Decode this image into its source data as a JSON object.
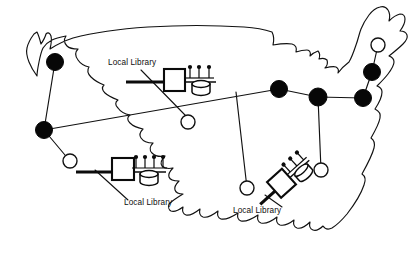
{
  "figure": {
    "name": "us-library-network-map",
    "background_color": "#ffffff",
    "line_color": "#111111",
    "fill_node_color": "#070707",
    "hollow_node_color": "#ffffff",
    "width": 420,
    "height": 278
  },
  "labels": [
    {
      "id": "label-northwest",
      "text": "Local Library",
      "x": 108,
      "y": 65
    },
    {
      "id": "label-southwest",
      "text": "Local Library",
      "x": 124,
      "y": 205
    },
    {
      "id": "label-southeast",
      "text": "Local Library",
      "x": 233,
      "y": 213
    }
  ],
  "nodes": {
    "hubs": [
      {
        "id": "hub-seattle",
        "x": 55,
        "y": 62,
        "r": 8.5
      },
      {
        "id": "hub-bay-area",
        "x": 44,
        "y": 130,
        "r": 8.5
      },
      {
        "id": "hub-chicago",
        "x": 279,
        "y": 89,
        "r": 8.5
      },
      {
        "id": "hub-cleveland",
        "x": 318,
        "y": 97,
        "r": 9.0
      },
      {
        "id": "hub-new-york",
        "x": 363,
        "y": 98,
        "r": 8.5
      },
      {
        "id": "hub-boston",
        "x": 372,
        "y": 72,
        "r": 8.5
      }
    ],
    "leaves": [
      {
        "id": "leaf-northwest-library",
        "x": 188,
        "y": 122,
        "r": 7.0
      },
      {
        "id": "leaf-southwest-library",
        "x": 70,
        "y": 161,
        "r": 7.0
      },
      {
        "id": "leaf-southeast-library",
        "x": 247,
        "y": 188,
        "r": 7.0
      },
      {
        "id": "leaf-mid-atlantic",
        "x": 321,
        "y": 170,
        "r": 7.0
      },
      {
        "id": "leaf-northeast-upper",
        "x": 378,
        "y": 45,
        "r": 7.0
      }
    ]
  },
  "links": [
    {
      "id": "link-seattle-bay",
      "from": "hub-seattle",
      "to": "hub-bay-area"
    },
    {
      "id": "link-bay-chicago",
      "from": "hub-bay-area",
      "to": "hub-chicago"
    },
    {
      "id": "link-bay-southwest",
      "from": "hub-bay-area",
      "to": "leaf-southwest-library"
    },
    {
      "id": "link-chicago-cleveland",
      "from": "hub-chicago",
      "to": "hub-cleveland"
    },
    {
      "id": "link-cleveland-newyork",
      "from": "hub-cleveland",
      "to": "hub-new-york"
    },
    {
      "id": "link-newyork-boston",
      "from": "hub-new-york",
      "to": "hub-boston"
    },
    {
      "id": "link-boston-upper",
      "from": "hub-boston",
      "to": "leaf-northeast-upper"
    },
    {
      "id": "link-cleveland-midatlantic",
      "from": "hub-cleveland",
      "to": "leaf-mid-atlantic"
    },
    {
      "id": "link-backbone-southeast",
      "from": "backbone",
      "to": "leaf-southeast-library"
    }
  ],
  "library_clusters": [
    {
      "id": "cluster-northwest",
      "terminal_count": 3,
      "rotation_deg": 0,
      "has_disk": true,
      "has_server_box": true
    },
    {
      "id": "cluster-southwest",
      "terminal_count": 4,
      "rotation_deg": 0,
      "has_disk": true,
      "has_server_box": true
    },
    {
      "id": "cluster-southeast",
      "terminal_count": 3,
      "rotation_deg": -42,
      "has_disk": true,
      "has_server_box": true
    }
  ],
  "legend_semantics": {
    "filled_circle": "regional hub node",
    "hollow_circle": "local library node",
    "box_icon": "server",
    "lollipop_icon": "terminal",
    "cylinder_icon": "disk storage"
  }
}
